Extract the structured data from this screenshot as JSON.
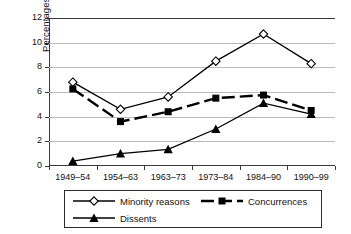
{
  "figure": {
    "caption_remnant": "",
    "background_color": "#ffffff"
  },
  "chart_data": {
    "type": "line",
    "title": "",
    "xlabel": "",
    "ylabel": "Percentages of citations",
    "categories": [
      "1949–54",
      "1954–63",
      "1963–73",
      "1973–84",
      "1984–90",
      "1990–99"
    ],
    "ylim": [
      0,
      12
    ],
    "yticks": [
      0,
      2,
      4,
      6,
      8,
      10,
      12
    ],
    "ytick_labels": [
      "0",
      "2",
      "4",
      "6",
      "8",
      "10",
      "12"
    ],
    "grid": true,
    "grid_axis": "y",
    "grid_color": "#b9b9b9",
    "legend_position": "bottom",
    "series": [
      {
        "name": "Minority reasons",
        "marker": "open-diamond",
        "line_style": "solid",
        "color": "#000000",
        "values": [
          6.8,
          4.6,
          5.6,
          8.5,
          10.7,
          8.3
        ]
      },
      {
        "name": "Concurrences",
        "marker": "filled-square",
        "line_style": "dashed",
        "color": "#000000",
        "values": [
          6.25,
          3.6,
          4.4,
          5.5,
          5.75,
          4.5
        ]
      },
      {
        "name": "Dissents",
        "marker": "filled-triangle",
        "line_style": "solid",
        "color": "#000000",
        "values": [
          0.4,
          1.0,
          1.35,
          3.0,
          5.1,
          4.2
        ]
      }
    ]
  }
}
